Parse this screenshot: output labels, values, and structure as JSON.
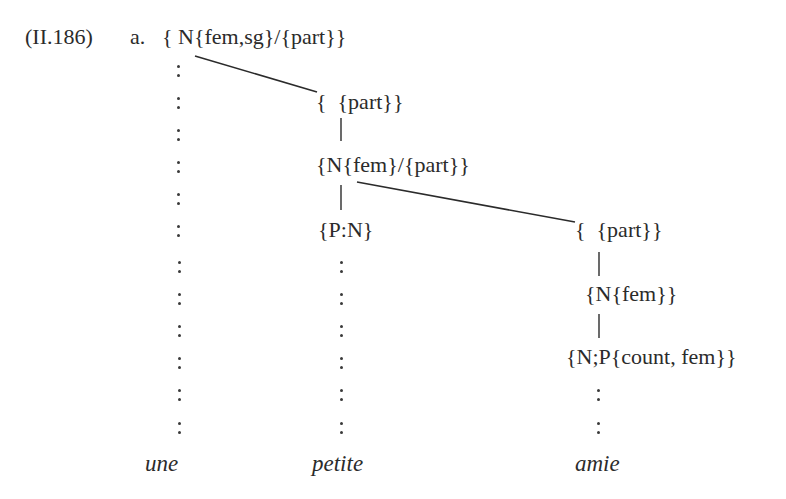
{
  "example": {
    "number": "(II.186)",
    "sublabel": "a."
  },
  "nodes": {
    "root": "{ N{fem,sg}/{part}}",
    "col2_top": "{  {part}}",
    "col2_mid": "{N{fem}/{part}}",
    "col2_low": "{P:N}",
    "col3_top": "{  {part}}",
    "col3_mid": "{N{fem}}",
    "col3_low": "{N;P{count, fem}}"
  },
  "words": {
    "w1": "une",
    "w2": "petite",
    "w3": "amie"
  },
  "colors": {
    "ink": "#2b2b2b",
    "background": "#ffffff"
  }
}
